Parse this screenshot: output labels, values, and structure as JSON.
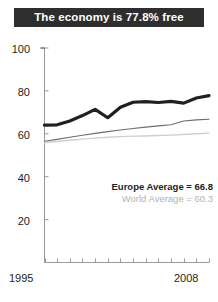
{
  "title": {
    "text": "The economy is 77.8% free",
    "background": "#2e2e2e",
    "color": "#ffffff"
  },
  "legend": {
    "europe": "Europe Average = 66.8",
    "world": "World Average = 60.3",
    "europe_color": "#231f20",
    "world_color": "#b3b3b3"
  },
  "axis": {
    "y_ticks": [
      "100",
      "80",
      "60",
      "40",
      "20"
    ],
    "x_first": "1995",
    "x_last": "2008"
  },
  "chart_data": {
    "type": "line",
    "title": "The economy is 77.8% free",
    "xlabel": "",
    "ylabel": "",
    "xlim": [
      1995,
      2008
    ],
    "ylim": [
      0,
      100
    ],
    "y_ticks": [
      20,
      40,
      60,
      80,
      100
    ],
    "x_ticks": [
      1995,
      1996,
      1997,
      1998,
      1999,
      2000,
      2001,
      2002,
      2003,
      2004,
      2005,
      2006,
      2007,
      2008
    ],
    "grid": false,
    "legend_position": "inside-lower-right",
    "annotations": [
      "Europe Average = 66.8",
      "World Average = 60.3"
    ],
    "x": [
      1995,
      1996,
      1997,
      1998,
      1999,
      2000,
      2001,
      2002,
      2003,
      2004,
      2005,
      2006,
      2007,
      2008
    ],
    "series": [
      {
        "name": "Country economic freedom",
        "color": "#231f20",
        "width": 3.2,
        "values": [
          64.0,
          64.2,
          66.0,
          68.5,
          71.4,
          67.5,
          72.4,
          74.7,
          75.0,
          74.6,
          75.1,
          74.3,
          76.7,
          77.8
        ]
      },
      {
        "name": "Europe Average",
        "color": "#6d6d6d",
        "width": 1.1,
        "values": [
          56.5,
          57.4,
          58.4,
          59.3,
          60.2,
          61.0,
          61.8,
          62.5,
          63.1,
          63.7,
          64.2,
          66.0,
          66.5,
          66.8
        ]
      },
      {
        "name": "World Average",
        "color": "#cfcfcf",
        "width": 1.4,
        "values": [
          55.8,
          56.4,
          57.0,
          57.5,
          58.0,
          58.4,
          58.7,
          58.9,
          59.0,
          59.2,
          59.4,
          59.7,
          60.0,
          60.3
        ]
      }
    ]
  }
}
